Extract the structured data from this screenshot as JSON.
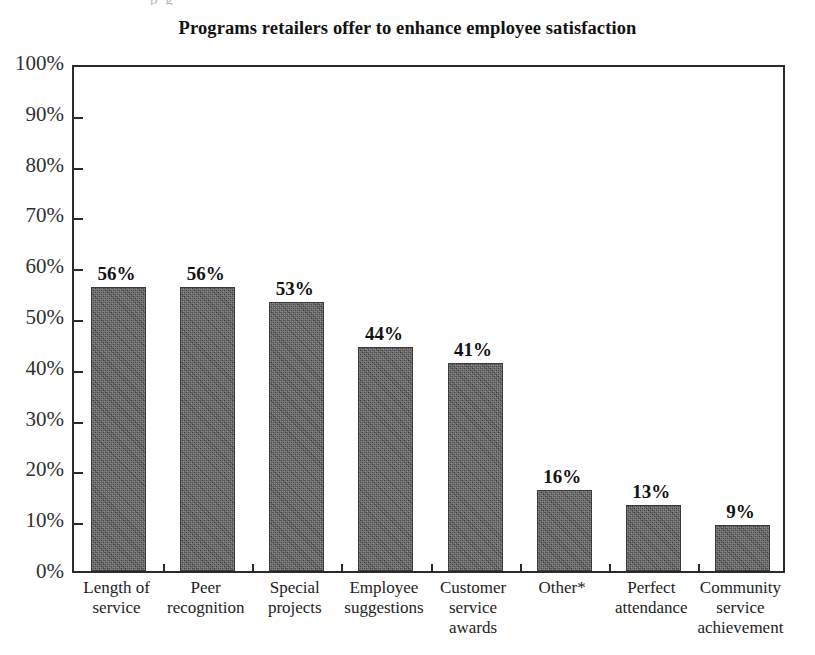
{
  "scan_remnant": "p g",
  "chart_data": {
    "type": "bar",
    "title": "Programs retailers offer to enhance employee satisfaction",
    "xlabel": "",
    "ylabel": "",
    "ylim": [
      0,
      100
    ],
    "ytick_labels": [
      "100%",
      "90%",
      "80%",
      "70%",
      "60%",
      "50%",
      "40%",
      "30%",
      "20%",
      "10%",
      "0%"
    ],
    "ytick_values": [
      100,
      90,
      80,
      70,
      60,
      50,
      40,
      30,
      20,
      10,
      0
    ],
    "grid": false,
    "legend": "none",
    "bar_color": "#4b4b4b",
    "axis_color": "#2b2b2b",
    "categories": [
      "Length of service",
      "Peer recognition",
      "Special projects",
      "Employee suggestions",
      "Customer service awards",
      "Other*",
      "Perfect attendance",
      "Community service achievement"
    ],
    "category_lines": [
      [
        "Length of",
        "service"
      ],
      [
        "Peer",
        "recognition"
      ],
      [
        "Special",
        "projects"
      ],
      [
        "Employee",
        "suggestions"
      ],
      [
        "Customer",
        "service",
        "awards"
      ],
      [
        "Other*"
      ],
      [
        "Perfect",
        "attendance"
      ],
      [
        "Community",
        "service",
        "achievement"
      ]
    ],
    "values": [
      56,
      56,
      53,
      44,
      41,
      16,
      13,
      9
    ],
    "value_labels": [
      "56%",
      "56%",
      "53%",
      "44%",
      "41%",
      "16%",
      "13%",
      "9%"
    ]
  }
}
